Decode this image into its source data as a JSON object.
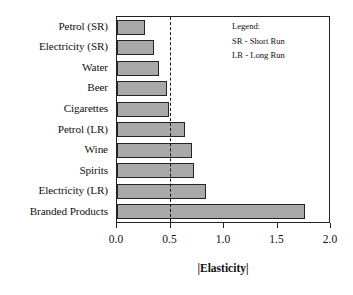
{
  "chart_data": {
    "type": "bar",
    "orientation": "horizontal",
    "title": "",
    "xlabel": "|Elasticity|",
    "ylabel": "",
    "xlim": [
      0.0,
      2.0
    ],
    "xticks": [
      "0.0",
      "0.5",
      "1.0",
      "1.5",
      "2.0"
    ],
    "xtick_values": [
      0.0,
      0.5,
      1.0,
      1.5,
      2.0
    ],
    "grid": false,
    "categories": [
      "Petrol (SR)",
      "Electricity (SR)",
      "Water",
      "Beer",
      "Cigarettes",
      "Petrol (LR)",
      "Wine",
      "Spirits",
      "Electricity (LR)",
      "Branded Products"
    ],
    "values": [
      0.26,
      0.35,
      0.4,
      0.47,
      0.49,
      0.64,
      0.71,
      0.73,
      0.84,
      1.77
    ],
    "reference_line": {
      "value": 0.5,
      "style": "dashed"
    },
    "bar_fill_color": "#a9a9a9",
    "bar_border_color": "#242424",
    "axis_color": "#222222"
  },
  "legend": {
    "title": "Legend:",
    "entries": [
      "SR - Short Run",
      "LR - Long Run"
    ]
  }
}
